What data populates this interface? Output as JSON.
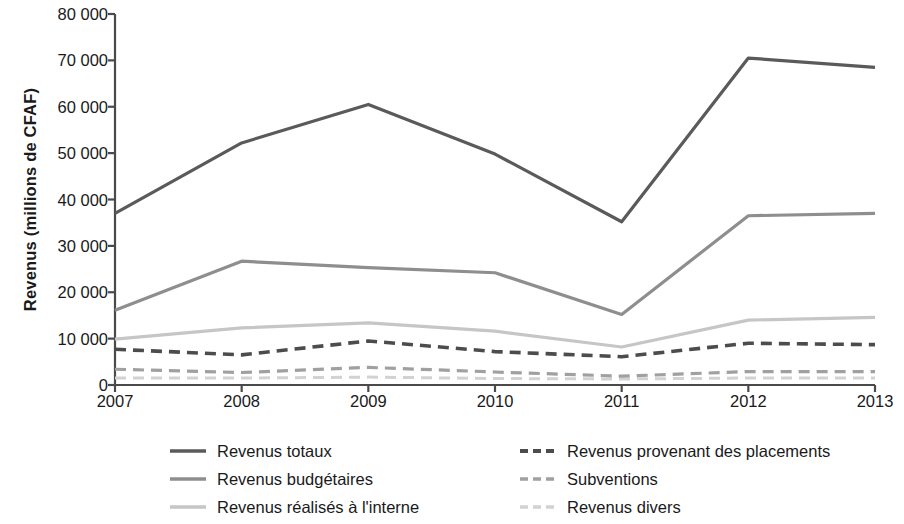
{
  "chart_data": {
    "type": "line",
    "title": "",
    "xlabel": "",
    "ylabel": "Revenus (millions de CFAF)",
    "x": [
      2007,
      2008,
      2009,
      2010,
      2011,
      2012,
      2013
    ],
    "x_tick_labels": [
      "2007",
      "2008",
      "2009",
      "2010",
      "2011",
      "2012",
      "2013"
    ],
    "y_tick_labels": [
      "80 000",
      "70 000",
      "60 000",
      "50 000",
      "40 000",
      "30 000",
      "20 000",
      "10 000",
      "0"
    ],
    "y_ticks": [
      80000,
      70000,
      60000,
      50000,
      40000,
      30000,
      20000,
      10000,
      0
    ],
    "ylim": [
      0,
      80000
    ],
    "xlim": [
      2007,
      2013
    ],
    "grid": false,
    "legend_position": "below",
    "legend_columns": 2,
    "series": [
      {
        "name": "Revenus totaux",
        "color": "#5a5a5a",
        "style": "solid",
        "width": 3.2,
        "values": [
          37000,
          52200,
          60500,
          49800,
          35200,
          70500,
          68500
        ]
      },
      {
        "name": "Revenus budgétaires",
        "color": "#8e8e8e",
        "style": "solid",
        "width": 3.2,
        "values": [
          16100,
          26700,
          25300,
          24200,
          15200,
          36500,
          37000
        ]
      },
      {
        "name": "Revenus réalisés à l'interne",
        "color": "#c6c6c6",
        "style": "solid",
        "width": 3.2,
        "values": [
          9900,
          12300,
          13400,
          11600,
          8200,
          14000,
          14600
        ]
      },
      {
        "name": "Revenus provenant des placements",
        "color": "#4c4c4c",
        "style": "dashed",
        "width": 3.6,
        "values": [
          7700,
          6500,
          9500,
          7200,
          6100,
          9000,
          8700
        ]
      },
      {
        "name": "Subventions",
        "color": "#a0a0a0",
        "style": "dashed",
        "width": 3.2,
        "values": [
          3400,
          2700,
          3800,
          2800,
          1900,
          2900,
          2900
        ]
      },
      {
        "name": "Revenus divers",
        "color": "#d2d2d2",
        "style": "dashed",
        "width": 3.0,
        "values": [
          1500,
          1500,
          1700,
          1400,
          1300,
          1500,
          1500
        ]
      }
    ]
  },
  "axis": {
    "axis_color": "#4a4a4a",
    "plot_left": 115,
    "plot_right": 875,
    "plot_top": 14,
    "plot_bottom": 385
  },
  "legend": {
    "items": [
      {
        "label": "Revenus totaux",
        "col": 0,
        "row": 0
      },
      {
        "label": "Revenus budgétaires",
        "col": 0,
        "row": 1
      },
      {
        "label": "Revenus réalisés à l'interne",
        "col": 0,
        "row": 2
      },
      {
        "label": "Revenus provenant des placements",
        "col": 1,
        "row": 0
      },
      {
        "label": "Subventions",
        "col": 1,
        "row": 1
      },
      {
        "label": "Revenus divers",
        "col": 1,
        "row": 2
      }
    ]
  }
}
